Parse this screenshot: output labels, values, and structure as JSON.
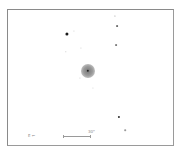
{
  "chart": {
    "frame": {
      "x": 7,
      "y": 9,
      "w": 167,
      "h": 137
    },
    "object": {
      "x": 88,
      "y": 71,
      "halo_radius": 7,
      "core_radius": 1.2,
      "core_color": "#222222"
    },
    "stars": [
      {
        "x": 67,
        "y": 34,
        "r": 1.6,
        "color": "#1a1a1a"
      },
      {
        "x": 74,
        "y": 31,
        "r": 0.6,
        "color": "#c8c8c8"
      },
      {
        "x": 81,
        "y": 48,
        "r": 0.6,
        "color": "#c8c8c8"
      },
      {
        "x": 66,
        "y": 52,
        "r": 0.7,
        "color": "#c0c0c0"
      },
      {
        "x": 115,
        "y": 16,
        "r": 0.6,
        "color": "#8c8c8c"
      },
      {
        "x": 117,
        "y": 26,
        "r": 0.9,
        "color": "#6a6a6a"
      },
      {
        "x": 116,
        "y": 45,
        "r": 0.9,
        "color": "#7a7a7a"
      },
      {
        "x": 80,
        "y": 78,
        "r": 0.6,
        "color": "#c8c8c8"
      },
      {
        "x": 93,
        "y": 88,
        "r": 0.6,
        "color": "#d0d0d0"
      },
      {
        "x": 119,
        "y": 117,
        "r": 1.1,
        "color": "#2a2a2a"
      },
      {
        "x": 125,
        "y": 130,
        "r": 0.8,
        "color": "#9a9a9a"
      }
    ],
    "scale_bar": {
      "x1": 63,
      "x2": 91,
      "y": 136,
      "label": "30\"",
      "label_x": 88,
      "label_y": 130
    },
    "compass": {
      "label": "E ←",
      "x": 28,
      "y": 134
    }
  }
}
